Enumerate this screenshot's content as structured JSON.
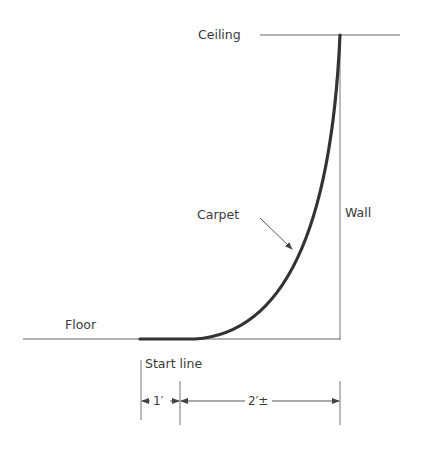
{
  "diagram": {
    "labels": {
      "ceiling": "Ceiling",
      "wall": "Wall",
      "floor": "Floor",
      "carpet": "Carpet",
      "start_line": "Start line"
    },
    "dimensions": {
      "first": "1′",
      "second": "2′±"
    },
    "colors": {
      "line": "#555555",
      "carpet": "#333333",
      "text": "#3a3a3a"
    }
  }
}
